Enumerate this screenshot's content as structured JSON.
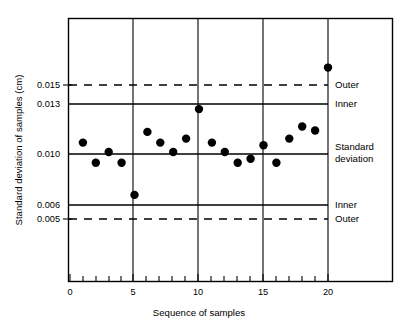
{
  "chart_data": {
    "type": "scatter",
    "title": "",
    "xlabel": "Sequence of samples",
    "ylabel": "Standard deviation of samples (cm)",
    "xlim": [
      0,
      20.8
    ],
    "ylim": [
      0.0035,
      0.0182
    ],
    "grid": "vertical gridlines at x = 5, 10, 15, 20",
    "legend": "none (right-side annotations label the control limits)",
    "x": [
      1,
      2,
      3,
      4,
      5,
      6,
      7,
      8,
      9,
      10,
      11,
      12,
      13,
      14,
      15,
      16,
      17,
      18,
      19,
      20
    ],
    "values": [
      0.0107,
      0.0092,
      0.01,
      0.0092,
      0.0068,
      0.0115,
      0.0107,
      0.01,
      0.011,
      0.0132,
      0.0107,
      0.01,
      0.0092,
      0.0095,
      0.0105,
      0.0092,
      0.011,
      0.0119,
      0.0116,
      0.0163
    ],
    "series": [
      {
        "name": "Standard deviation of samples",
        "values": [
          0.0107,
          0.0092,
          0.01,
          0.0092,
          0.0068,
          0.0115,
          0.0107,
          0.01,
          0.011,
          0.0132,
          0.0107,
          0.01,
          0.0092,
          0.0095,
          0.0105,
          0.0092,
          0.011,
          0.0119,
          0.0116,
          0.0163
        ]
      }
    ],
    "control_lines": [
      {
        "value": 0.015,
        "style": "dashed",
        "label": "Outer",
        "tick_label": "0.015"
      },
      {
        "value": 0.013,
        "style": "solid",
        "label": "Inner",
        "tick_label": "0.013"
      },
      {
        "value": 0.01,
        "style": "solid",
        "label": "Standard deviation",
        "tick_label": "0.010"
      },
      {
        "value": 0.006,
        "style": "solid",
        "label": "Inner",
        "tick_label": "0.006"
      },
      {
        "value": 0.005,
        "style": "dashed",
        "label": "Outer",
        "tick_label": "0.005"
      }
    ],
    "yticks": [
      0.015,
      0.013,
      0.01,
      0.006,
      0.005
    ],
    "ytick_labels": [
      "0.015",
      "0.013",
      "0.010",
      "0.006",
      "0.005"
    ],
    "xticks": [
      0,
      5,
      10,
      15,
      20
    ],
    "xtick_labels": [
      "0",
      "5",
      "10",
      "15",
      "20"
    ],
    "xminor_ticks": [
      1,
      2,
      3,
      4,
      6,
      7,
      8,
      9,
      11,
      12,
      13,
      14,
      16,
      17,
      18,
      19
    ],
    "colors": {
      "background": "#ffffff",
      "ink": "#000000",
      "marker": "#000000"
    }
  },
  "annotations": {
    "outer_upper": "Outer",
    "inner_upper": "Inner",
    "standard_line1": "Standard",
    "standard_line2": "deviation",
    "inner_lower": "Inner",
    "outer_lower": "Outer"
  },
  "axes": {
    "x_title": "Sequence of samples",
    "y_title": "Standard deviation of samples (cm)"
  }
}
